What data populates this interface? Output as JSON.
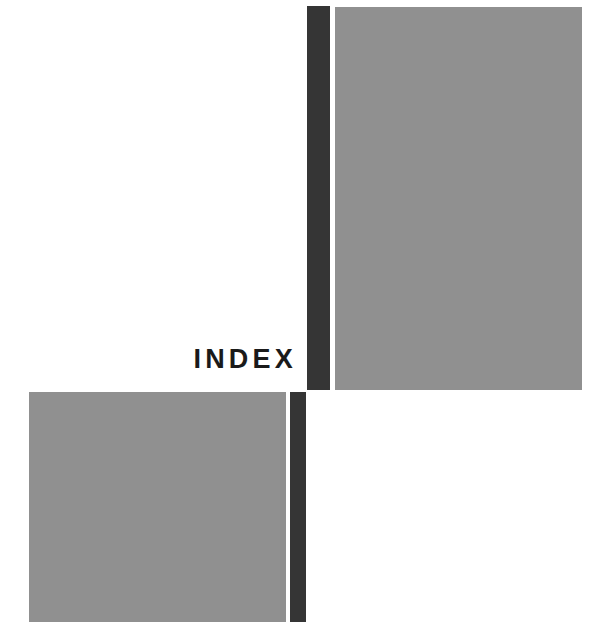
{
  "page": {
    "type": "section-divider",
    "section_title": "INDEX",
    "background_color": "#ffffff",
    "width": 607,
    "height": 622
  },
  "decorations": {
    "gray_color": "#909090",
    "dark_color": "#353535",
    "blocks": [
      {
        "name": "gray-block-top-right",
        "shape": "rectangle",
        "color": "#909090",
        "x": 335,
        "y": 7,
        "width": 247,
        "height": 383
      },
      {
        "name": "dark-bar-upper",
        "shape": "rectangle",
        "color": "#353535",
        "x": 307,
        "y": 6,
        "width": 23,
        "height": 384
      },
      {
        "name": "gray-block-bottom-left",
        "shape": "rectangle",
        "color": "#909090",
        "x": 29,
        "y": 392,
        "width": 257,
        "height": 230
      },
      {
        "name": "dark-bar-lower",
        "shape": "rectangle",
        "color": "#353535",
        "x": 290,
        "y": 392,
        "width": 16,
        "height": 230
      }
    ]
  },
  "typography": {
    "title_color": "#1a1a1a",
    "title_weight": "bold",
    "title_size_px": 27,
    "title_letter_spacing_px": 4.2
  }
}
